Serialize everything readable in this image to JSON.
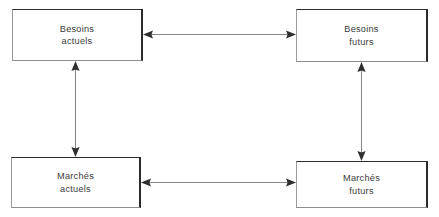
{
  "diagram": {
    "type": "block-diagram",
    "background_color": "#ffffff",
    "box_border_color": "#2b2b2b",
    "arrow_line_color": "#8a8a8a",
    "arrow_head_color": "#2e2e2e",
    "text_color": "#3a3a3a",
    "nodes": [
      {
        "id": "besoins-actuels",
        "line1": "Besoins",
        "line2": "actuels",
        "position": "top-left",
        "x": 12,
        "y": 9,
        "width": 131,
        "height": 52
      },
      {
        "id": "besoins-futurs",
        "line1": "Besoins",
        "line2": "futurs",
        "position": "top-right",
        "x": 296,
        "y": 9,
        "width": 132,
        "height": 53
      },
      {
        "id": "marches-actuels",
        "line1": "Marchés",
        "line2": "actuels",
        "position": "bottom-left",
        "x": 11,
        "y": 157,
        "width": 130,
        "height": 51
      },
      {
        "id": "marches-futurs",
        "line1": "Marchés",
        "line2": "futurs",
        "position": "bottom-right",
        "x": 296,
        "y": 161,
        "width": 132,
        "height": 47
      }
    ],
    "connectors": [
      {
        "id": "top-horizontal",
        "from": "besoins-actuels",
        "to": "besoins-futurs",
        "orientation": "horizontal",
        "arrowheads": "both"
      },
      {
        "id": "bottom-horizontal",
        "from": "marches-actuels",
        "to": "marches-futurs",
        "orientation": "horizontal",
        "arrowheads": "both"
      },
      {
        "id": "left-vertical",
        "from": "besoins-actuels",
        "to": "marches-actuels",
        "orientation": "vertical",
        "arrowheads": "both"
      },
      {
        "id": "right-vertical",
        "from": "besoins-futurs",
        "to": "marches-futurs",
        "orientation": "vertical",
        "arrowheads": "both"
      }
    ]
  }
}
